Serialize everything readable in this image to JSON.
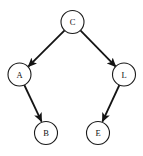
{
  "diagram": {
    "type": "directed-graph",
    "title": "",
    "background_color": "#ffffff",
    "node_fill": "#ffffff",
    "node_stroke": "#1a1a1a",
    "edge_color": "#141414",
    "node_radius": 11.5,
    "nodes": [
      {
        "id": "C",
        "label": "C",
        "cx": 72.5,
        "cy": 22.0
      },
      {
        "id": "A",
        "label": "A",
        "cx": 19.5,
        "cy": 74.5
      },
      {
        "id": "L",
        "label": "L",
        "cx": 124.0,
        "cy": 74.5
      },
      {
        "id": "B",
        "label": "B",
        "cx": 46.0,
        "cy": 133.0
      },
      {
        "id": "E",
        "label": "E",
        "cx": 98.0,
        "cy": 133.0
      }
    ],
    "edges": [
      {
        "from": "C",
        "to": "A",
        "directed": true,
        "arrow": "filled"
      },
      {
        "from": "C",
        "to": "L",
        "directed": true,
        "arrow": "filled"
      },
      {
        "from": "A",
        "to": "B",
        "directed": true,
        "arrow": "filled"
      },
      {
        "from": "L",
        "to": "E",
        "directed": true,
        "arrow": "filled"
      }
    ]
  }
}
